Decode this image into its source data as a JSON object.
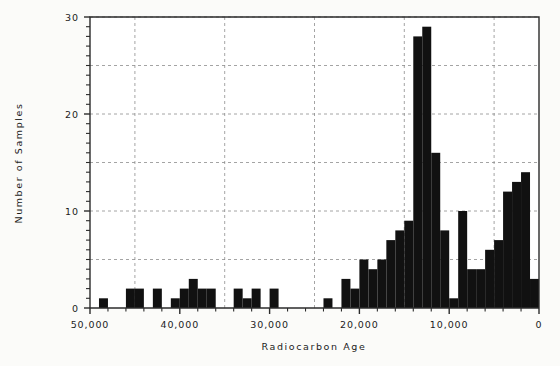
{
  "chart_data": {
    "type": "bar",
    "title": "",
    "subtitle": "",
    "xlabel": "Radiocarbon Age",
    "ylabel": "Number of Samples",
    "orientation": "vertical",
    "x_axis_reversed": true,
    "xlim": [
      0,
      50000
    ],
    "ylim": [
      0,
      30
    ],
    "bin_width": 1000,
    "x_tick_labels": [
      "50,000",
      "40,000",
      "30,000",
      "20,000",
      "10,000",
      "0"
    ],
    "x_tick_values": [
      50000,
      40000,
      30000,
      20000,
      10000,
      0
    ],
    "x_minor_tick_interval": 2000,
    "y_tick_labels": [
      "0",
      "10",
      "20",
      "30"
    ],
    "y_tick_values": [
      0,
      10,
      20,
      30
    ],
    "y_minor_tick_interval": 1,
    "grid": true,
    "grid_x_values": [
      45000,
      35000,
      25000,
      15000,
      5000
    ],
    "grid_y_values": [
      5,
      10,
      15,
      20,
      25,
      30
    ],
    "legend": null,
    "bar_color": "#111111",
    "background_color": "#fbfbf9",
    "categories": [
      "49,000",
      "48,000",
      "47,000",
      "46,000",
      "45,000",
      "44,000",
      "43,000",
      "42,000",
      "41,000",
      "40,000",
      "39,000",
      "38,000",
      "37,000",
      "36,000",
      "35,000",
      "34,000",
      "33,000",
      "32,000",
      "31,000",
      "30,000",
      "29,000",
      "28,000",
      "27,000",
      "26,000",
      "25,000",
      "24,000",
      "23,000",
      "22,000",
      "21,000",
      "20,000",
      "19,000",
      "18,000",
      "17,000",
      "16,000",
      "15,000",
      "14,000",
      "13,000",
      "12,000",
      "11,000",
      "10,000",
      "9,000",
      "8,000",
      "7,000",
      "6,000",
      "5,000",
      "4,000",
      "3,000",
      "2,000",
      "1,000",
      "0"
    ],
    "bins": [
      {
        "x_start": 50000,
        "x_end": 49000,
        "value": 0
      },
      {
        "x_start": 49000,
        "x_end": 48000,
        "value": 1
      },
      {
        "x_start": 48000,
        "x_end": 47000,
        "value": 0
      },
      {
        "x_start": 47000,
        "x_end": 46000,
        "value": 0
      },
      {
        "x_start": 46000,
        "x_end": 45000,
        "value": 2
      },
      {
        "x_start": 45000,
        "x_end": 44000,
        "value": 2
      },
      {
        "x_start": 44000,
        "x_end": 43000,
        "value": 0
      },
      {
        "x_start": 43000,
        "x_end": 42000,
        "value": 2
      },
      {
        "x_start": 42000,
        "x_end": 41000,
        "value": 0
      },
      {
        "x_start": 41000,
        "x_end": 40000,
        "value": 1
      },
      {
        "x_start": 40000,
        "x_end": 39000,
        "value": 2
      },
      {
        "x_start": 39000,
        "x_end": 38000,
        "value": 3
      },
      {
        "x_start": 38000,
        "x_end": 37000,
        "value": 2
      },
      {
        "x_start": 37000,
        "x_end": 36000,
        "value": 2
      },
      {
        "x_start": 36000,
        "x_end": 35000,
        "value": 0
      },
      {
        "x_start": 35000,
        "x_end": 34000,
        "value": 0
      },
      {
        "x_start": 34000,
        "x_end": 33000,
        "value": 2
      },
      {
        "x_start": 33000,
        "x_end": 32000,
        "value": 1
      },
      {
        "x_start": 32000,
        "x_end": 31000,
        "value": 2
      },
      {
        "x_start": 31000,
        "x_end": 30000,
        "value": 0
      },
      {
        "x_start": 30000,
        "x_end": 29000,
        "value": 2
      },
      {
        "x_start": 29000,
        "x_end": 28000,
        "value": 0
      },
      {
        "x_start": 28000,
        "x_end": 27000,
        "value": 0
      },
      {
        "x_start": 27000,
        "x_end": 26000,
        "value": 0
      },
      {
        "x_start": 26000,
        "x_end": 25000,
        "value": 0
      },
      {
        "x_start": 25000,
        "x_end": 24000,
        "value": 0
      },
      {
        "x_start": 24000,
        "x_end": 23000,
        "value": 1
      },
      {
        "x_start": 23000,
        "x_end": 22000,
        "value": 0
      },
      {
        "x_start": 22000,
        "x_end": 21000,
        "value": 3
      },
      {
        "x_start": 21000,
        "x_end": 20000,
        "value": 2
      },
      {
        "x_start": 20000,
        "x_end": 19000,
        "value": 5
      },
      {
        "x_start": 19000,
        "x_end": 18000,
        "value": 4
      },
      {
        "x_start": 18000,
        "x_end": 17000,
        "value": 5
      },
      {
        "x_start": 17000,
        "x_end": 16000,
        "value": 7
      },
      {
        "x_start": 16000,
        "x_end": 15000,
        "value": 8
      },
      {
        "x_start": 15000,
        "x_end": 14000,
        "value": 9
      },
      {
        "x_start": 14000,
        "x_end": 13000,
        "value": 28
      },
      {
        "x_start": 13000,
        "x_end": 12000,
        "value": 29
      },
      {
        "x_start": 12000,
        "x_end": 11000,
        "value": 16
      },
      {
        "x_start": 11000,
        "x_end": 10000,
        "value": 8
      },
      {
        "x_start": 10000,
        "x_end": 9000,
        "value": 1
      },
      {
        "x_start": 9000,
        "x_end": 8000,
        "value": 10
      },
      {
        "x_start": 8000,
        "x_end": 7000,
        "value": 4
      },
      {
        "x_start": 7000,
        "x_end": 6000,
        "value": 4
      },
      {
        "x_start": 6000,
        "x_end": 5000,
        "value": 6
      },
      {
        "x_start": 5000,
        "x_end": 4000,
        "value": 7
      },
      {
        "x_start": 4000,
        "x_end": 3000,
        "value": 12
      },
      {
        "x_start": 3000,
        "x_end": 2000,
        "value": 13
      },
      {
        "x_start": 2000,
        "x_end": 1000,
        "value": 14
      },
      {
        "x_start": 1000,
        "x_end": 0,
        "value": 3
      }
    ],
    "values": [
      0,
      1,
      0,
      0,
      2,
      2,
      0,
      2,
      0,
      1,
      2,
      3,
      2,
      2,
      0,
      0,
      2,
      1,
      2,
      0,
      2,
      0,
      0,
      0,
      0,
      0,
      1,
      0,
      3,
      2,
      5,
      4,
      5,
      7,
      8,
      9,
      28,
      29,
      16,
      8,
      1,
      10,
      4,
      4,
      6,
      7,
      12,
      13,
      14,
      3
    ]
  }
}
